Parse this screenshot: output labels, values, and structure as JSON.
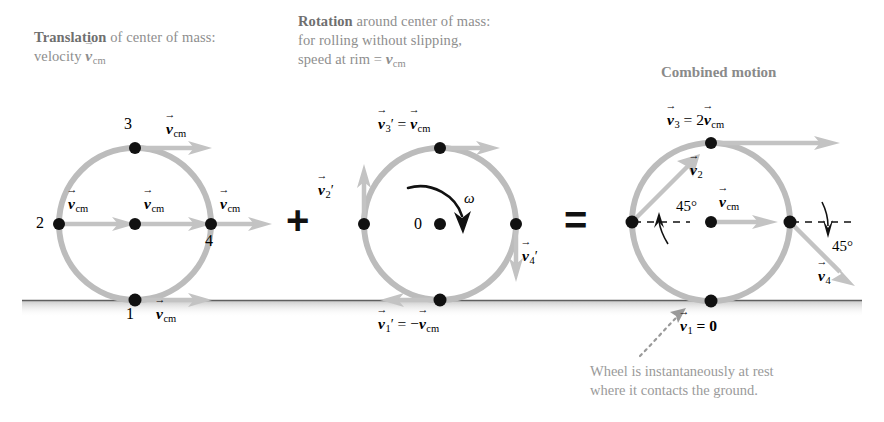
{
  "figure": {
    "title_left_bold": "Translation",
    "title_left_rest": " of center of mass:",
    "title_left_line2": "velocity ",
    "title_left_line2_sym": "v",
    "title_left_line2_sub": "cm",
    "title_mid_bold": "Rotation",
    "title_mid_rest": " around center of mass:",
    "title_mid_line2": "for rolling without slipping,",
    "title_mid_line3_a": "speed at rim = ",
    "title_mid_line3_sym": "v",
    "title_mid_line3_sub": "cm",
    "title_right": "Combined motion",
    "operator_plus": "+",
    "operator_equals": "=",
    "annotation_line1": "Wheel is instantaneously at rest",
    "annotation_line2": "where it contacts the ground."
  },
  "wheel_translation": {
    "name": "Translation of center of mass",
    "point_labels": {
      "p1": "1",
      "p2": "2",
      "p3": "3",
      "p4": "4"
    },
    "vectors": {
      "top": {
        "sym": "v",
        "sub": "cm",
        "prime": ""
      },
      "left": {
        "sym": "v",
        "sub": "cm",
        "prime": ""
      },
      "center": {
        "sym": "v",
        "sub": "cm",
        "prime": ""
      },
      "right": {
        "sym": "v",
        "sub": "cm",
        "prime": ""
      },
      "bottom": {
        "sym": "v",
        "sub": "cm",
        "prime": ""
      }
    }
  },
  "wheel_rotation": {
    "name": "Rotation around center of mass",
    "center_label": "0",
    "omega_label": "ω",
    "vectors": {
      "top": {
        "lhs_sym": "v",
        "lhs_sub": "3",
        "lhs_prime": "′",
        "rel": " = ",
        "rhs_sym": "v",
        "rhs_sub": "cm"
      },
      "left": {
        "lhs_sym": "v",
        "lhs_sub": "2",
        "lhs_prime": "′"
      },
      "right": {
        "lhs_sym": "v",
        "lhs_sub": "4",
        "lhs_prime": "′"
      },
      "bottom": {
        "lhs_sym": "v",
        "lhs_sub": "1",
        "lhs_prime": "′",
        "rel": " = −",
        "rhs_sym": "v",
        "rhs_sub": "cm"
      }
    }
  },
  "wheel_combined": {
    "name": "Combined motion",
    "vectors": {
      "top": {
        "lhs_sym": "v",
        "lhs_sub": "3",
        "rel": " = 2",
        "rhs_sym": "v",
        "rhs_sub": "cm"
      },
      "upleft": {
        "lhs_sym": "v",
        "lhs_sub": "2"
      },
      "center": {
        "lhs_sym": "v",
        "lhs_sub": "cm"
      },
      "downright": {
        "lhs_sym": "v",
        "lhs_sub": "4"
      },
      "bottom": {
        "lhs_sym": "v",
        "lhs_sub": "1",
        "rel": " = ",
        "rhs_zero": "0"
      }
    },
    "angle_left": "45°",
    "angle_right": "45°"
  },
  "colors": {
    "rim": "#b9b9b9",
    "arrow": "#bdbdbd",
    "ground": "#5a5a5a",
    "dot": "#111111",
    "caption_text": "#8e8e8e",
    "math_text": "#000000"
  }
}
